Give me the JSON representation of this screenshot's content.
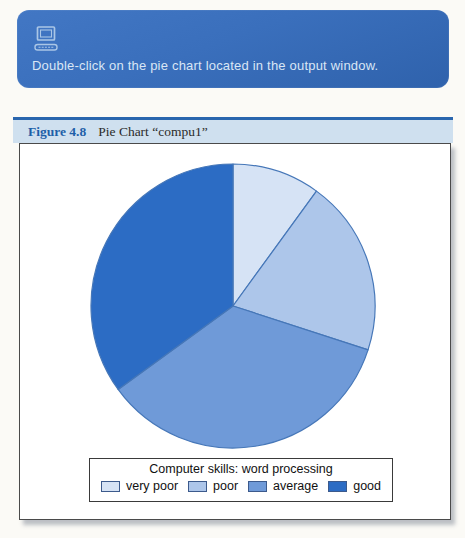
{
  "banner": {
    "icon": "computer-icon",
    "text": "Double-click on the pie chart located in the output window."
  },
  "figure": {
    "label": "Figure 4.8",
    "title": "Pie Chart “compu1”"
  },
  "chart_data": {
    "type": "pie",
    "title": "Computer skills: word processing",
    "categories": [
      "very poor",
      "poor",
      "average",
      "good"
    ],
    "values": [
      10,
      20,
      35,
      35
    ],
    "values_unit": "percent (estimated from slice angles)",
    "start_angle_deg": 0,
    "direction": "clockwise",
    "colors": [
      "#d6e3f5",
      "#adc6ea",
      "#6f9ad8",
      "#2c6cc4"
    ],
    "slice_stroke": "#4677b8",
    "legend_position": "bottom-center"
  },
  "theme": {
    "banner_bg": "#3a6fbc",
    "banner_text_color": "#d9e6f5",
    "banner_icon_color": "#aac6e6",
    "caption_bg": "#cfe0ef",
    "caption_accent": "#2a66ae",
    "figure_label_color": "#1e5fa8",
    "panel_bg": "#ffffff"
  }
}
